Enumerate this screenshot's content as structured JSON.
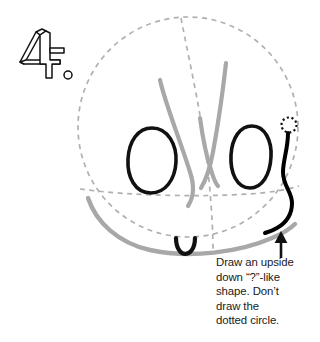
{
  "figure": {
    "step_number": "4.",
    "caption": "Draw an upside\ndown “?”-like\nshape. Don’t\ndraw the\ndotted circle.",
    "caption_lines": [
      "Draw an upside",
      "down “?”-like",
      "shape. Don’t",
      "draw the",
      "dotted circle."
    ],
    "colors": {
      "guide_dashed": "#b0b0b0",
      "previous_strokes_grey": "#a8a8a8",
      "new_stroke_black": "#000000",
      "outline_black": "#111111",
      "text": "#1a1a1a",
      "background": "#ffffff"
    },
    "elements": {
      "head_guide_circle": "dashed-head-circle",
      "vertical_center_guide": "dashed-vertical-guide",
      "horizontal_eye_guide": "dashed-horizontal-guide",
      "jaw_curve": "grey-jaw-curve",
      "hair_strands": "grey-w-hair-shape",
      "left_eye": "black-left-eye",
      "right_eye": "black-right-eye",
      "mouth": "black-mouth",
      "new_ear_shape": "black-upside-down-question-mark",
      "small_dotted_circle": "dotted-reference-circle",
      "pointer": "up-arrow"
    }
  }
}
